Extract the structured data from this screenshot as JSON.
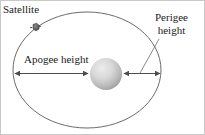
{
  "figure": {
    "background_color": "#ffffff",
    "frame_color": "#b8b8b8",
    "line_color": "#595959",
    "text_color": "#222222"
  },
  "labels": {
    "satellite": "Satellite",
    "perigee_line1": "Perigee",
    "perigee_line2": "height",
    "apogee": "Apogee height"
  },
  "icons": {
    "satellite_marker": "satellite-marker-icon",
    "earth": "earth-sphere-icon"
  },
  "geometry": {
    "orbit": {
      "cx": 87,
      "cy": 70,
      "rx": 74,
      "ry": 58
    },
    "earth": {
      "cx": 106,
      "cy": 74,
      "r": 16,
      "fill_light": "#e2e2e2",
      "fill_dark": "#a9a9a9"
    },
    "satellite": {
      "x": 36,
      "y": 27
    },
    "apogee_arrow": {
      "x1": 14,
      "x2": 89,
      "y": 73
    },
    "perigee_arrow": {
      "x1": 123,
      "x2": 161,
      "y": 73
    },
    "perigee_leader": {
      "x1": 158,
      "y1": 38,
      "x2": 140,
      "y2": 73
    }
  }
}
